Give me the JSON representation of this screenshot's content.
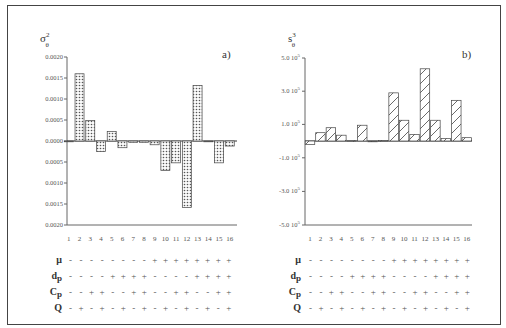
{
  "chart_data": [
    {
      "type": "bar",
      "panel_label": "a)",
      "ylabel": "σ²θ",
      "ylabel_main": "σ",
      "ylabel_sup": "2",
      "ylabel_sub": "θ",
      "categories": [
        "1",
        "2",
        "3",
        "4",
        "5",
        "6",
        "7",
        "8",
        "9",
        "10",
        "11",
        "12",
        "13",
        "14",
        "15",
        "16"
      ],
      "values": [
        0.0,
        0.0016,
        0.00049,
        -0.00025,
        0.00023,
        -0.00016,
        -3e-05,
        -3e-05,
        -9e-05,
        -0.0007,
        -0.00052,
        -0.00158,
        0.00132,
        -1e-05,
        -0.00052,
        -0.00012
      ],
      "ylim": [
        -0.002,
        0.002
      ],
      "yticks": [
        0.002,
        0.0015,
        0.001,
        0.0005,
        0.0,
        -0.0005,
        -0.001,
        -0.0015,
        -0.002
      ],
      "ytick_labels": [
        "0.0020",
        "0.0015",
        "0.0010",
        "0.0005",
        "0.0000",
        "0.0005",
        "0.0010",
        "0.0015",
        "0.0020"
      ],
      "fill_pattern": "dotted",
      "grid": false
    },
    {
      "type": "bar",
      "panel_label": "b)",
      "ylabel": "s³θ",
      "ylabel_main": "s",
      "ylabel_sup": "3",
      "ylabel_sub": "θ",
      "categories": [
        "1",
        "2",
        "3",
        "4",
        "5",
        "6",
        "7",
        "8",
        "9",
        "10",
        "11",
        "12",
        "13",
        "14",
        "15",
        "16"
      ],
      "values": [
        -2e-06,
        5e-06,
        8e-06,
        3.5e-06,
        2e-07,
        9.5e-06,
        0.0,
        3e-07,
        2.9e-05,
        1.25e-05,
        4e-06,
        4.35e-05,
        1.25e-05,
        1.5e-06,
        2.45e-05,
        2e-06
      ],
      "ylim": [
        -5e-05,
        5e-05
      ],
      "yticks": [
        5e-05,
        3e-05,
        1e-05,
        -1e-05,
        -3e-05,
        -5e-05
      ],
      "ytick_labels": [
        "5.0 10",
        "3.0 10",
        "1.0 10",
        "-1.0 10",
        "-3.0 10",
        "-5.0 10"
      ],
      "ytick_exponent": "5",
      "fill_pattern": "hatched",
      "grid": false
    }
  ],
  "design_matrix": {
    "factors": [
      {
        "name": "μ",
        "signs": [
          "-",
          "-",
          "-",
          "-",
          "-",
          "-",
          "-",
          "-",
          "+",
          "+",
          "+",
          "+",
          "+",
          "+",
          "+",
          "+"
        ]
      },
      {
        "name": "dp",
        "signs": [
          "-",
          "-",
          "-",
          "-",
          "+",
          "+",
          "+",
          "+",
          "-",
          "-",
          "-",
          "-",
          "+",
          "+",
          "+",
          "+"
        ]
      },
      {
        "name": "Cp",
        "signs": [
          "-",
          "-",
          "+",
          "+",
          "-",
          "-",
          "+",
          "+",
          "-",
          "-",
          "+",
          "+",
          "-",
          "-",
          "+",
          "+"
        ]
      },
      {
        "name": "Q",
        "signs": [
          "-",
          "+",
          "-",
          "+",
          "-",
          "+",
          "-",
          "+",
          "-",
          "+",
          "-",
          "+",
          "-",
          "+",
          "-",
          "+"
        ]
      }
    ]
  }
}
